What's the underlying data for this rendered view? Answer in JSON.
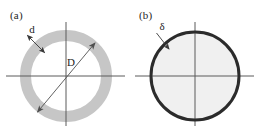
{
  "figure": {
    "background_color": "#ffffff",
    "panels": [
      {
        "id": "a",
        "label": "(a)",
        "shape": "annulus",
        "shape_name": "thick-walled-ring",
        "ring_color": "#c6c6c6",
        "ring_outer_diameter_px": 92,
        "ring_thickness_px": 11,
        "center_px": [
          66,
          76
        ],
        "axes": {
          "color": "#5a5a5a",
          "horizontal": true,
          "vertical": true,
          "h_extent_px": [
            6,
            125
          ],
          "v_extent_px": [
            22,
            126
          ]
        },
        "annotations": [
          {
            "name": "wall-thickness",
            "label": "d",
            "arrow": "double-headed",
            "arrow_color": "#333333",
            "points_to": "ring-wall-upper-left"
          },
          {
            "name": "diameter",
            "label": "D",
            "arrow": "double-headed",
            "arrow_color": "#4a4a4a",
            "points_to": "ring-inner-diagonal"
          }
        ]
      },
      {
        "id": "b",
        "label": "(b)",
        "shape": "circle-outline",
        "shape_name": "thin-walled-circle",
        "outline_color": "#2b2b2b",
        "outline_thickness_px": 3,
        "fill_color": "#f0f0f0",
        "outer_diameter_px": 92,
        "center_px": [
          66,
          76
        ],
        "axes": {
          "color": "#5a5a5a",
          "horizontal": true,
          "vertical": true,
          "h_extent_px": [
            6,
            125
          ],
          "v_extent_px": [
            22,
            126
          ]
        },
        "annotations": [
          {
            "name": "wall-thickness",
            "label": "δ",
            "arrow": "single-headed",
            "arrow_color": "#333333",
            "points_to": "circle-wall-upper-left"
          }
        ]
      }
    ]
  }
}
